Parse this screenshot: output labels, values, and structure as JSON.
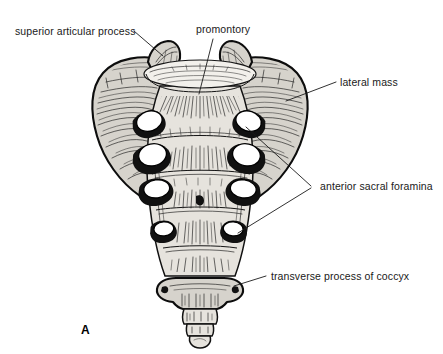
{
  "figure": {
    "panel_letter": "A",
    "background_color": "#ffffff",
    "ink_color": "#1a1a1a",
    "bone_fill_color": "#d6d3cc"
  },
  "labels": [
    {
      "id": "superior-articular-process",
      "text": "superior articular process",
      "text_x": 15,
      "text_y": 35,
      "anchor": "start",
      "leaders": [
        {
          "x1": 134,
          "y1": 31,
          "x2": 163,
          "y2": 56
        }
      ]
    },
    {
      "id": "promontory",
      "text": "promontory",
      "text_x": 196,
      "text_y": 33,
      "anchor": "start",
      "leaders": [
        {
          "x1": 213,
          "y1": 39,
          "x2": 199,
          "y2": 94
        }
      ]
    },
    {
      "id": "lateral-mass",
      "text": "lateral mass",
      "text_x": 340,
      "text_y": 86,
      "anchor": "start",
      "leaders": [
        {
          "x1": 336,
          "y1": 82,
          "x2": 286,
          "y2": 101
        }
      ]
    },
    {
      "id": "anterior-sacral-foramina",
      "text": "anterior sacral foramina",
      "text_x": 320,
      "text_y": 190,
      "anchor": "start",
      "leaders": [
        {
          "x1": 311,
          "y1": 186,
          "x2": 246,
          "y2": 127
        },
        {
          "x1": 311,
          "y1": 188,
          "x2": 238,
          "y2": 233
        }
      ]
    },
    {
      "id": "transverse-process-of-coccyx",
      "text": "transverse process of coccyx",
      "text_x": 271,
      "text_y": 280,
      "anchor": "start",
      "leaders": [
        {
          "x1": 266,
          "y1": 276,
          "x2": 234,
          "y2": 286
        }
      ]
    }
  ],
  "anatomy": {
    "promontory": {
      "center_x": 200,
      "center_y": 74,
      "radius_x": 56,
      "radius_y": 13
    },
    "superior_articular_processes": [
      {
        "side": "left",
        "center_x": 160,
        "center_y": 52
      },
      {
        "side": "right",
        "center_x": 240,
        "center_y": 52
      }
    ],
    "lateral_masses": [
      {
        "side": "left",
        "center_x": 125,
        "center_y": 105
      },
      {
        "side": "right",
        "center_x": 276,
        "center_y": 105
      }
    ],
    "anterior_sacral_foramina": [
      {
        "side": "left",
        "pair": 1,
        "cx": 150,
        "cy": 123,
        "rx": 13,
        "ry": 10,
        "rotation": -18
      },
      {
        "side": "left",
        "pair": 2,
        "cx": 152,
        "cy": 157,
        "rx": 14,
        "ry": 11,
        "rotation": -12
      },
      {
        "side": "left",
        "pair": 3,
        "cx": 156,
        "cy": 191,
        "rx": 13,
        "ry": 9,
        "rotation": -8
      },
      {
        "side": "left",
        "pair": 4,
        "cx": 163,
        "cy": 231,
        "rx": 10,
        "ry": 7,
        "rotation": -5
      },
      {
        "side": "right",
        "pair": 1,
        "cx": 248,
        "cy": 123,
        "rx": 13,
        "ry": 10,
        "rotation": 18
      },
      {
        "side": "right",
        "pair": 2,
        "cx": 247,
        "cy": 157,
        "rx": 14,
        "ry": 11,
        "rotation": 12
      },
      {
        "side": "right",
        "pair": 3,
        "cx": 244,
        "cy": 191,
        "rx": 13,
        "ry": 9,
        "rotation": 8
      },
      {
        "side": "right",
        "pair": 4,
        "cx": 234,
        "cy": 231,
        "rx": 10,
        "ry": 7,
        "rotation": 5
      }
    ],
    "transverse_ridges_y": [
      140,
      174,
      208,
      248
    ],
    "coccyx": {
      "transverse_process_y": 288,
      "transverse_process_left_x": 163,
      "transverse_process_right_x": 236,
      "apex_y": 344
    }
  }
}
